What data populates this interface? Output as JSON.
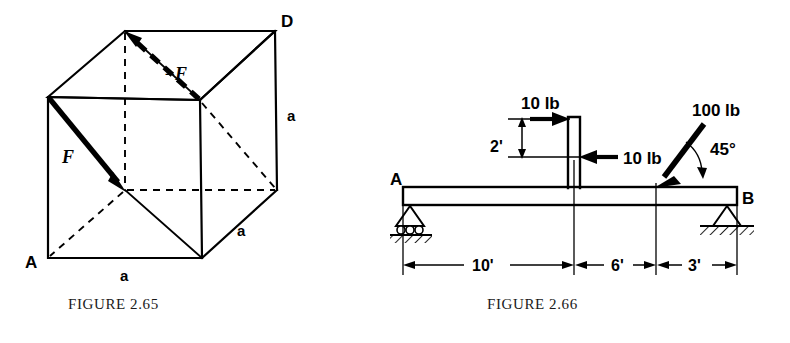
{
  "figures": [
    {
      "id": "figure-2-65",
      "caption": "FIGURE 2.65",
      "type": "cube-force-diagram",
      "description": "Cube of edge length a with equal and opposite forces F and -F along body diagonals",
      "labels": {
        "vertex_a": "A",
        "vertex_d": "D",
        "force_positive": "F",
        "force_negative": "−F",
        "edge_bottom": "a",
        "edge_right_depth": "a",
        "edge_right_vertical": "a"
      }
    },
    {
      "id": "figure-2-66",
      "caption": "FIGURE 2.66",
      "type": "beam-load-diagram",
      "description": "Simply supported beam A-B with a vertical post carrying a couple and an inclined 100 lb load",
      "labels": {
        "support_left": "A",
        "support_right": "B",
        "load_top": "10 lb",
        "load_mid": "10 lb",
        "load_incline": "100 lb",
        "angle": "45°",
        "post_height": "2'"
      },
      "dimensions": [
        {
          "label": "10'",
          "value": 10,
          "unit": "ft"
        },
        {
          "label": "6'",
          "value": 6,
          "unit": "ft"
        },
        {
          "label": "3'",
          "value": 3,
          "unit": "ft"
        }
      ],
      "loads": [
        {
          "label": "10 lb",
          "magnitude": 10,
          "unit": "lb",
          "direction": "right"
        },
        {
          "label": "10 lb",
          "magnitude": 10,
          "unit": "lb",
          "direction": "left"
        },
        {
          "label": "100 lb",
          "magnitude": 100,
          "unit": "lb",
          "direction": "down-left at 45°"
        }
      ],
      "supports": [
        {
          "at": "A",
          "kind": "roller"
        },
        {
          "at": "B",
          "kind": "pin"
        }
      ]
    }
  ],
  "colors": {
    "ink": "#000000",
    "paper": "#ffffff",
    "caption_ink": "#1a1a1a"
  }
}
